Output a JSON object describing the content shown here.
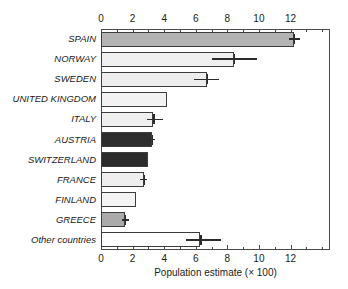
{
  "chart_data": {
    "type": "bar",
    "orientation": "horizontal",
    "title": "",
    "xlabel": "Population estimate (× 100)",
    "ylabel": "",
    "xlim": [
      0,
      14.5
    ],
    "xticks": [
      0,
      2,
      4,
      6,
      8,
      10,
      12
    ],
    "xticklabels": [
      "0",
      "2",
      "4",
      "6",
      "8",
      "10",
      "12"
    ],
    "minor_xticks": [
      1,
      3,
      5,
      7,
      9,
      11,
      13,
      14
    ],
    "grid": false,
    "legend": null,
    "axes": {
      "top_axis": true,
      "bottom_axis": true,
      "top_ticklabels": [
        "0",
        "2",
        "4",
        "6",
        "8",
        "10",
        "12"
      ],
      "bottom_ticklabels": [
        "0",
        "2",
        "4",
        "6",
        "8",
        "10",
        "12"
      ]
    },
    "categories": [
      "SPAIN",
      "NORWAY",
      "SWEDEN",
      "UNITED KINGDOM",
      "ITALY",
      "AUSTRIA",
      "SWITZERLAND",
      "FRANCE",
      "FINLAND",
      "GREECE",
      "Other countries"
    ],
    "values": [
      12.2,
      8.4,
      6.7,
      4.2,
      3.3,
      3.2,
      3.0,
      2.7,
      2.2,
      1.5,
      6.3
    ],
    "error_low": [
      11.9,
      7.0,
      5.9,
      null,
      2.9,
      3.0,
      null,
      2.5,
      null,
      1.3,
      5.4
    ],
    "error_high": [
      12.6,
      9.9,
      7.5,
      null,
      3.9,
      3.4,
      null,
      2.9,
      null,
      1.8,
      7.6
    ],
    "bar_colors": [
      "#b3b3b3",
      "#f0f0f0",
      "#ededed",
      "#f2f2f2",
      "#efefef",
      "#2e2e2e",
      "#2b2b2b",
      "#eeeeee",
      "#f4f4f4",
      "#aaaaaa",
      "#ffffff"
    ],
    "bar_edge_color": "#3d3d3d",
    "error_color": "#2b2b2b"
  }
}
